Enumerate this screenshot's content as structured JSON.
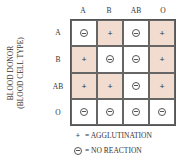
{
  "columns": [
    "A",
    "B",
    "AB",
    "O"
  ],
  "rows": [
    {
      "label": "A",
      "cells": [
        "-",
        "+",
        "-",
        "+"
      ]
    },
    {
      "label": "B",
      "cells": [
        "+",
        "-",
        "-",
        "+"
      ]
    },
    {
      "label": "AB",
      "cells": [
        "+",
        "+",
        "-",
        "+"
      ]
    },
    {
      "label": "O",
      "cells": [
        "-",
        "-",
        "-",
        "-"
      ]
    }
  ],
  "side_label": {
    "line1": "BLOOD DONOR",
    "line2": "(BLOOD CELL TYPE)"
  },
  "legend": {
    "plus_symbol": "+",
    "plus_text": "= AGGLUTINATION",
    "minus_text": "= NO REACTION"
  },
  "colors": {
    "agglutination_fill": "#f2dccf",
    "no_reaction_fill": "#ffffff"
  }
}
